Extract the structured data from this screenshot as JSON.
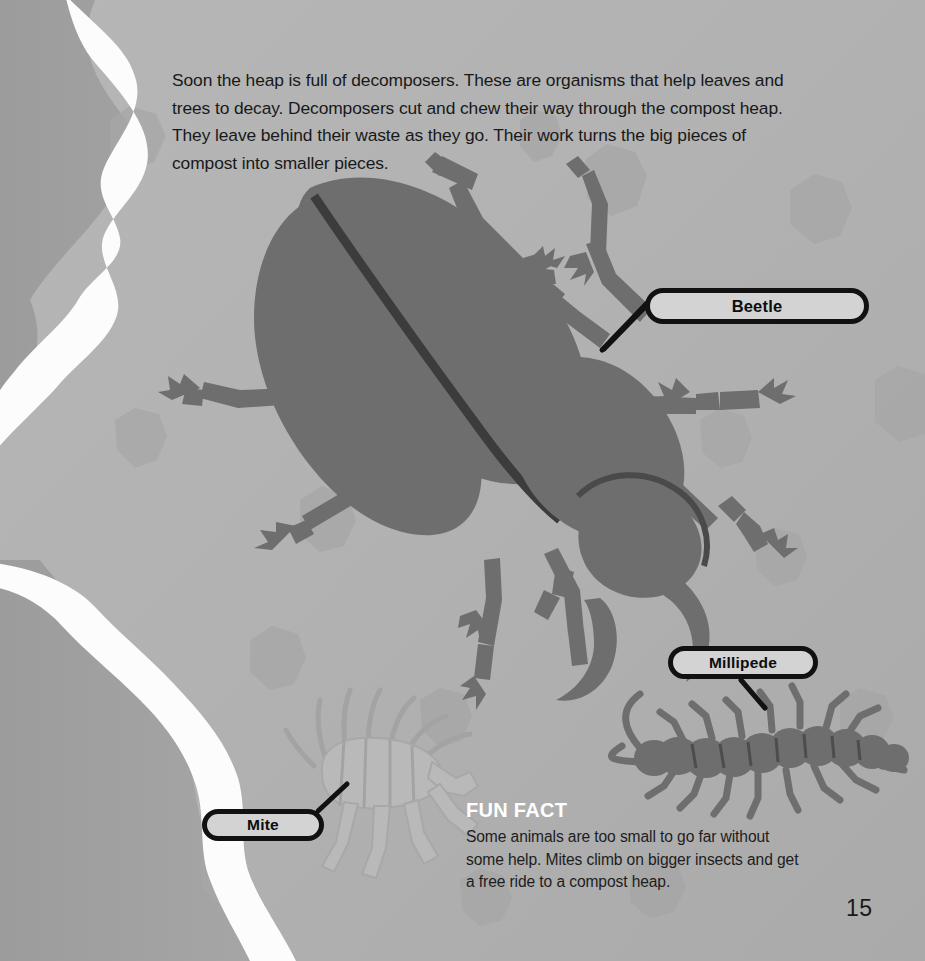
{
  "page": {
    "number": "15",
    "background_color": "#b2b2b2",
    "accent_white": "#ffffff",
    "ink_color": "#191919",
    "creature_color": "#6e6e6e"
  },
  "body_text": "Soon the heap is full of decomposers. These are organisms that help leaves and trees to decay. Decomposers cut and chew their way through the compost heap. They leave behind their waste as they go. Their work turns the big pieces of compost into smaller pieces.",
  "callouts": [
    {
      "label": "Beetle",
      "target": "beetle-illustration"
    },
    {
      "label": "Millipede",
      "target": "millipede-illustration"
    },
    {
      "label": "Mite",
      "target": "mite-illustration"
    }
  ],
  "fun_fact": {
    "title": "FUN FACT",
    "body": "Some animals are too small to go far without some help. Mites climb on bigger insects and get a free ride to a compost heap."
  },
  "illustrations": [
    {
      "name": "beetle-illustration",
      "kind": "stag-beetle-silhouette"
    },
    {
      "name": "millipede-illustration",
      "kind": "millipede-silhouette"
    },
    {
      "name": "mite-illustration",
      "kind": "mite-silhouette"
    },
    {
      "name": "leaf-texture",
      "kind": "scattered-leaf-shadows"
    },
    {
      "name": "white-ribbon",
      "kind": "wavy-vertical-divider"
    }
  ]
}
